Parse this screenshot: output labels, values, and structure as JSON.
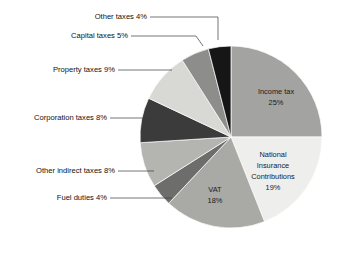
{
  "chart_data": {
    "type": "pie",
    "title": "",
    "subtitle": "",
    "xlabel": "",
    "ylabel": "",
    "legend_position": "none",
    "grid": false,
    "units": "percent",
    "total": 100,
    "start_angle_deg": 0,
    "direction": "clockwise",
    "categories": [
      "Income tax",
      "National Insurance Contributions",
      "VAT",
      "Fuel duties",
      "Other indirect taxes",
      "Corporation taxes",
      "Property taxes",
      "Capital taxes",
      "Other taxes"
    ],
    "values": [
      25,
      19,
      18,
      4,
      8,
      8,
      9,
      5,
      4
    ],
    "slices": [
      {
        "name": "Income tax",
        "value": 25,
        "label_line1": "Income tax",
        "label_line2": "25%",
        "label_placement": "inside",
        "color": "#a3a3a1"
      },
      {
        "name": "National Insurance Contributions",
        "value": 19,
        "label_line1": "National",
        "label_line2": "Insurance",
        "label_line3": "Contributions",
        "label_line4": "19%",
        "label_placement": "inside",
        "color": "#eeeeec"
      },
      {
        "name": "VAT",
        "value": 18,
        "label_line1": "VAT",
        "label_line2": "18%",
        "label_placement": "inside",
        "color": "#a9a9a6"
      },
      {
        "name": "Fuel duties",
        "value": 4,
        "label": "Fuel duties 4%",
        "label_placement": "outside",
        "color": "#6d6d6b"
      },
      {
        "name": "Other indirect taxes",
        "value": 8,
        "label": "Other indirect taxes 8%",
        "label_placement": "outside",
        "color": "#b4b4b1"
      },
      {
        "name": "Corporation taxes",
        "value": 8,
        "label": "Corporation taxes 8%",
        "label_placement": "outside",
        "color": "#3b3b3b"
      },
      {
        "name": "Property taxes",
        "value": 9,
        "label": "Property taxes 9%",
        "label_placement": "outside",
        "color": "#d8d8d4"
      },
      {
        "name": "Capital taxes",
        "value": 5,
        "label": "Capital taxes 5%",
        "label_placement": "outside",
        "color": "#8d8d8b"
      },
      {
        "name": "Other taxes",
        "value": 4,
        "label": "Other taxes 4%",
        "label_placement": "outside",
        "color": "#161616"
      }
    ],
    "colors": {
      "background": "#ffffff",
      "slice_border": "#ffffff",
      "leader_line": "#3a3a3a",
      "label_text": "#111111"
    }
  },
  "geometry": {
    "center_x": 231,
    "center_y": 137,
    "radius": 91
  }
}
